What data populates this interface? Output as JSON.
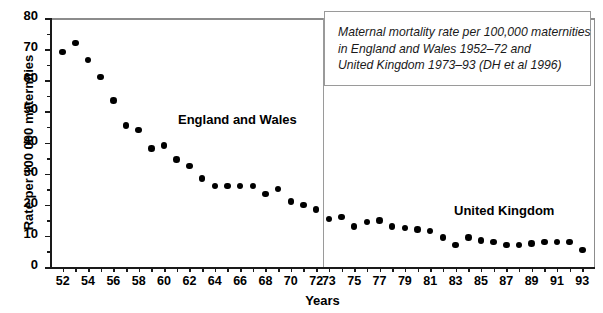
{
  "chart_data": {
    "type": "scatter",
    "title": "",
    "xlabel": "Years",
    "ylabel": "Rate per 100 000 maternities",
    "xlim": [
      51,
      94
    ],
    "ylim": [
      0,
      80
    ],
    "grid": false,
    "ytick_values": [
      0,
      10,
      20,
      30,
      40,
      50,
      60,
      70,
      80
    ],
    "ytick_labels": [
      "0",
      "10",
      "20",
      "30",
      "40",
      "50",
      "60",
      "70",
      "80"
    ],
    "ytick_minor_values": [
      5,
      15,
      25,
      35,
      45,
      55,
      65,
      75
    ],
    "xtick_values": [
      52,
      53,
      54,
      55,
      56,
      57,
      58,
      59,
      60,
      61,
      62,
      63,
      64,
      65,
      66,
      67,
      68,
      69,
      70,
      71,
      72,
      73,
      74,
      75,
      76,
      77,
      78,
      79,
      80,
      81,
      82,
      83,
      84,
      85,
      86,
      87,
      88,
      89,
      90,
      91,
      92,
      93
    ],
    "xtick_labels": [
      {
        "value": 52,
        "label": "52"
      },
      {
        "value": 54,
        "label": "54"
      },
      {
        "value": 56,
        "label": "56"
      },
      {
        "value": 58,
        "label": "58"
      },
      {
        "value": 60,
        "label": "60"
      },
      {
        "value": 62,
        "label": "62"
      },
      {
        "value": 64,
        "label": "64"
      },
      {
        "value": 66,
        "label": "66"
      },
      {
        "value": 68,
        "label": "68"
      },
      {
        "value": 70,
        "label": "70"
      },
      {
        "value": 72,
        "label": "72"
      },
      {
        "value": 73,
        "label": "73"
      },
      {
        "value": 75,
        "label": "75"
      },
      {
        "value": 77,
        "label": "77"
      },
      {
        "value": 79,
        "label": "79"
      },
      {
        "value": 81,
        "label": "81"
      },
      {
        "value": 83,
        "label": "83"
      },
      {
        "value": 85,
        "label": "85"
      },
      {
        "value": 87,
        "label": "87"
      },
      {
        "value": 89,
        "label": "89"
      },
      {
        "value": 91,
        "label": "91"
      },
      {
        "value": 93,
        "label": "93"
      }
    ],
    "divider_x": 72.5,
    "marker_color": "#000000",
    "series": [
      {
        "name": "England and Wales",
        "x": [
          52,
          53,
          54,
          55,
          56,
          57,
          58,
          59,
          60,
          61,
          62,
          63,
          64,
          65,
          66,
          67,
          68,
          69,
          70,
          71,
          72
        ],
        "values": [
          69.0,
          72.0,
          66.5,
          61.0,
          53.5,
          45.5,
          44.0,
          38.0,
          39.0,
          34.5,
          32.5,
          28.5,
          26.0,
          26.0,
          26.0,
          26.0,
          23.5,
          25.0,
          21.0,
          20.0,
          18.5
        ]
      },
      {
        "name": "United Kingdom",
        "x": [
          73,
          74,
          75,
          76,
          77,
          78,
          79,
          80,
          81,
          82,
          83,
          84,
          85,
          86,
          87,
          88,
          89,
          90,
          91,
          92,
          93
        ],
        "values": [
          15.5,
          16.0,
          13.0,
          14.5,
          15.0,
          13.0,
          12.5,
          12.0,
          11.5,
          9.5,
          7.0,
          9.5,
          8.5,
          8.0,
          7.0,
          7.0,
          7.5,
          8.0,
          8.0,
          8.0,
          5.5
        ]
      }
    ],
    "annotations": [
      {
        "name": "series-label-england-wales",
        "text": "England and Wales"
      },
      {
        "name": "series-label-united-kingdom",
        "text": "United Kingdom"
      }
    ],
    "caption": {
      "lines": [
        "Maternal mortality rate per 100,000 maternities",
        "in England and Wales 1952–72 and",
        "United Kingdom 1973–93 (DH et al 1996)"
      ]
    }
  }
}
